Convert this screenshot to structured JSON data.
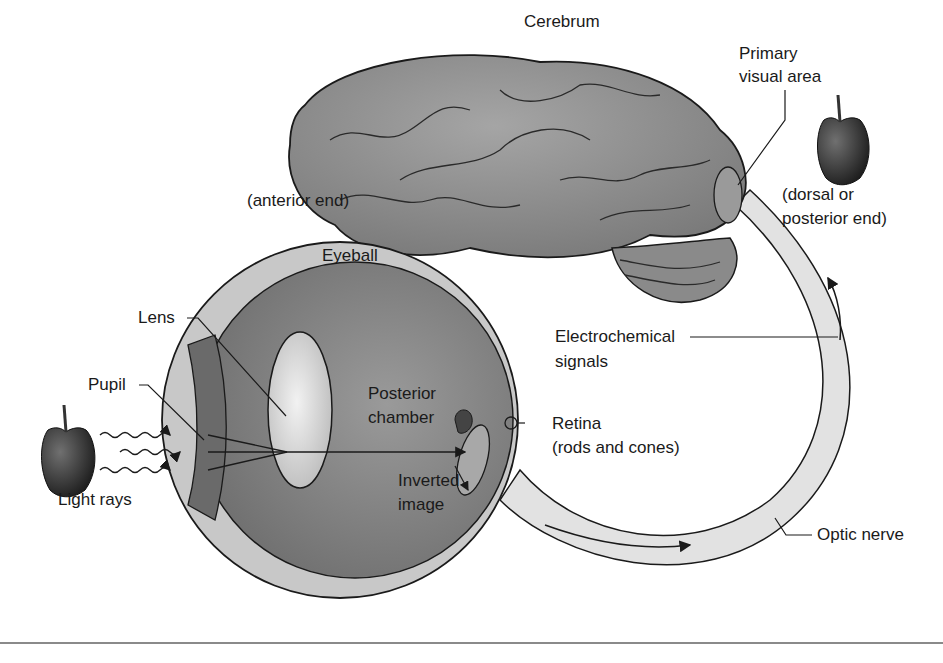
{
  "diagram": {
    "labels": {
      "cerebrum": "Cerebrum",
      "primary_visual_area_1": "Primary",
      "primary_visual_area_2": "visual area",
      "anterior_end": "(anterior end)",
      "dorsal_1": "(dorsal or",
      "dorsal_2": "posterior end)",
      "eyeball": "Eyeball",
      "lens": "Lens",
      "pupil": "Pupil",
      "light_rays": "Light rays",
      "posterior_chamber_1": "Posterior",
      "posterior_chamber_2": "chamber",
      "electrochemical_1": "Electrochemical",
      "electrochemical_2": "signals",
      "retina_1": "Retina",
      "retina_2": "(rods and cones)",
      "inverted_image_1": "Inverted",
      "inverted_image_2": "image",
      "optic_nerve": "Optic nerve"
    },
    "colors": {
      "brain": "#8c8c8c",
      "eye_interior": "#7d7d7d",
      "eye_wall": "#c8c8c8",
      "lens": "#e6e6e6",
      "nerve": "#e2e2e2",
      "apple": "#3a3a3a",
      "rule": "#8a8a8a"
    }
  }
}
